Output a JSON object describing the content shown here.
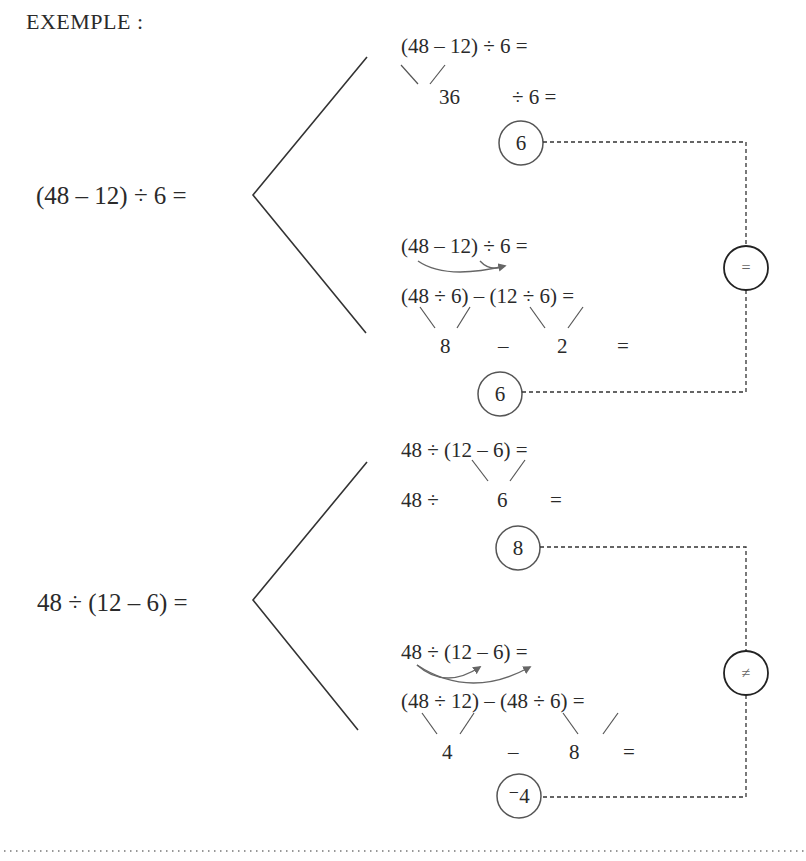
{
  "heading": "EXEMPLE :",
  "example1": {
    "expression": "(48 – 12) ÷ 6 =",
    "method_a": {
      "line1": "(48 – 12) ÷ 6 =",
      "line2_value": "36",
      "line2_rest": "÷ 6 =",
      "result": "6"
    },
    "method_b": {
      "line1": "(48 – 12) ÷ 6 =",
      "line2": "(48 ÷ 6) – (12 ÷ 6) =",
      "line3_a": "8",
      "line3_op": "–",
      "line3_b": "2",
      "line3_eq": "=",
      "result": "6"
    },
    "comparison": "="
  },
  "example2": {
    "expression": "48 ÷ (12 – 6) =",
    "method_a": {
      "line1": "48 ÷ (12 – 6) =",
      "line2_prefix": "48 ÷",
      "line2_value": "6",
      "line2_eq": "=",
      "result": "8"
    },
    "method_b": {
      "line1": "48 ÷ (12 – 6) =",
      "line2": "(48 ÷ 12) – (48 ÷ 6) =",
      "line3_a": "4",
      "line3_op": "–",
      "line3_b": "8",
      "line3_eq": "=",
      "result": "⁻4"
    },
    "comparison": "≠"
  },
  "colors": {
    "ink": "#2a2a2a",
    "arrow": "#666666",
    "dashed": "#333333"
  }
}
